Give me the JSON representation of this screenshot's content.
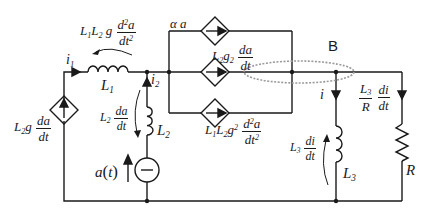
{
  "diagram": {
    "type": "circuit-schematic",
    "colors": {
      "wire": "#1a1a1a",
      "ellipse": "#9a9a9a",
      "background": "#ffffff"
    },
    "node_label": "B",
    "components": {
      "L1": {
        "name": "L",
        "sub": "1"
      },
      "L2": {
        "name": "L",
        "sub": "2"
      },
      "L3": {
        "name": "L",
        "sub": "3"
      },
      "R": {
        "name": "R"
      },
      "voltage_source": {
        "label": "a(t)",
        "a": "a",
        "t": "t"
      }
    },
    "currents": {
      "i1": {
        "name": "i",
        "sub": "1"
      },
      "i2": {
        "name": "i",
        "sub": "2"
      },
      "i": {
        "name": "i"
      }
    },
    "labels": {
      "left_source": {
        "prefix": "L",
        "prefix_sub": "2",
        "mid": "g",
        "num": "da",
        "den": "dt"
      },
      "L1_voltage": {
        "p1": "L",
        "s1": "1",
        "p2": "L",
        "s2": "2",
        "mid": "g",
        "num_d": "d",
        "num_sup": "2",
        "num_a": "a",
        "den": "dt",
        "den_sup": "2"
      },
      "L2_voltage": {
        "prefix": "L",
        "prefix_sub": "2",
        "num": "da",
        "den": "dt"
      },
      "source_top": {
        "text": "α a"
      },
      "source_mid": {
        "prefix": "L",
        "prefix_sub": "2",
        "mid": "g",
        "mid_sub": "2",
        "num": "da",
        "den": "dt"
      },
      "source_bottom": {
        "p1": "L",
        "s1": "1",
        "p2": "L",
        "s2": "2",
        "mid": "g",
        "mid_sup": "2",
        "num_d": "d",
        "num_sup": "2",
        "num_a": "a",
        "den": "dt",
        "den_sup": "2"
      },
      "L3_voltage": {
        "prefix": "L",
        "prefix_sub": "3",
        "num": "di",
        "den": "dt"
      },
      "R_current": {
        "num1": "L",
        "num1_sub": "3",
        "den1": "R",
        "num2": "di",
        "den2": "dt"
      }
    }
  }
}
